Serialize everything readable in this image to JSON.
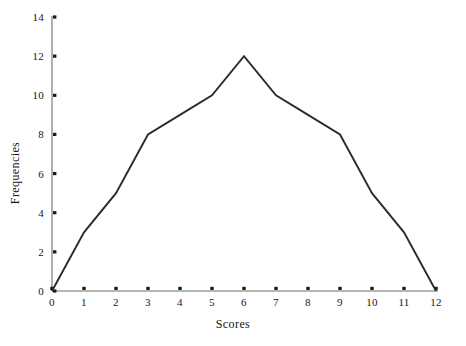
{
  "chart_data": {
    "type": "line",
    "title": "",
    "subtitle": "",
    "xlabel": "Scores",
    "ylabel": "Frequencies",
    "x": [
      0,
      1,
      2,
      3,
      4,
      5,
      6,
      7,
      8,
      9,
      10,
      11,
      12
    ],
    "values": [
      0,
      3,
      5,
      8,
      9,
      10,
      12,
      10,
      9,
      8,
      5,
      3,
      0
    ],
    "series": [
      {
        "name": "Frequencies",
        "values": [
          0,
          3,
          5,
          8,
          9,
          10,
          12,
          10,
          9,
          8,
          5,
          3,
          0
        ]
      }
    ],
    "xlim": [
      0,
      12
    ],
    "ylim": [
      0,
      14
    ],
    "xticks": [
      "0",
      "1",
      "2",
      "3",
      "4",
      "5",
      "6",
      "7",
      "8",
      "9",
      "10",
      "11",
      "12"
    ],
    "yticks": [
      "0",
      "2",
      "4",
      "6",
      "8",
      "10",
      "12",
      "14"
    ],
    "xtick_values": [
      0,
      1,
      2,
      3,
      4,
      5,
      6,
      7,
      8,
      9,
      10,
      11,
      12
    ],
    "ytick_values": [
      0,
      2,
      4,
      6,
      8,
      10,
      12,
      14
    ],
    "grid": false,
    "legend": false,
    "legend_position": "none",
    "annotations": [],
    "colors": {
      "line": "#2b2b2b",
      "axis": "#6e6e6e",
      "tick_mark": "#1a1a1a",
      "text": "#161616",
      "background": "#ffffff"
    }
  }
}
